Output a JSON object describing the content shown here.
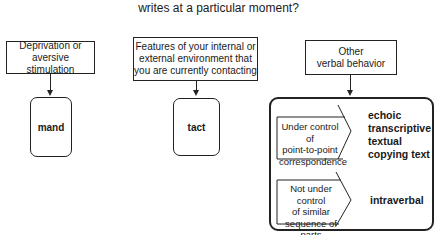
{
  "title": "writes at a particular moment?",
  "sources": [
    {
      "label_lines": [
        "Deprivation or",
        "aversive stimulation"
      ],
      "result": "mand"
    },
    {
      "label_lines": [
        "Features of your internal or",
        "external environment that",
        "you are currently contacting"
      ],
      "result": "tact"
    },
    {
      "label_lines": [
        "Other",
        "verbal behavior"
      ]
    }
  ],
  "other_verbal": {
    "point_to_point": {
      "label_lines": [
        "Under control of",
        "point-to-point",
        "correspondence"
      ],
      "results": [
        "echoic",
        "transcriptive",
        "textual",
        "copying text"
      ]
    },
    "not_point_to_point": {
      "label_lines": [
        "Not under control",
        "of similar",
        "sequence of parts"
      ],
      "results": [
        "intraverbal"
      ]
    }
  }
}
